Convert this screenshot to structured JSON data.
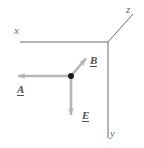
{
  "figure": {
    "width": 144,
    "height": 148,
    "background": "#ffffff"
  },
  "colors": {
    "axis": "#6a6a6a",
    "vector": "#b5b5b5",
    "vector_label": "#4f4f4f",
    "axis_label": "#6a6a6a",
    "point": "#1a1a1a"
  },
  "axes": {
    "origin": {
      "x": 108,
      "y": 42
    },
    "items": [
      {
        "name": "x",
        "label": "x",
        "label_position": {
          "x": 14,
          "y": 25
        },
        "from": {
          "x": 108,
          "y": 42
        },
        "to": {
          "x": 20,
          "y": 42
        },
        "direction": "left"
      },
      {
        "name": "z",
        "label": "z",
        "label_position": {
          "x": 126,
          "y": 4
        },
        "from": {
          "x": 108,
          "y": 42
        },
        "to": {
          "x": 133,
          "y": 14
        },
        "direction": "upper-right"
      },
      {
        "name": "y",
        "label": "y",
        "label_position": {
          "x": 110,
          "y": 128
        },
        "from": {
          "x": 108,
          "y": 42
        },
        "to": {
          "x": 108,
          "y": 138
        },
        "direction": "down"
      }
    ]
  },
  "point": {
    "label": "",
    "position": {
      "x": 71,
      "y": 76
    },
    "radius": 3
  },
  "vectors": [
    {
      "name": "A",
      "label": "A",
      "notation": "underlined",
      "from": {
        "x": 71,
        "y": 76
      },
      "to": {
        "x": 14,
        "y": 76
      },
      "direction": "left",
      "label_position": {
        "x": 17,
        "y": 84
      }
    },
    {
      "name": "B",
      "label": "B",
      "notation": "underlined",
      "from": {
        "x": 71,
        "y": 76
      },
      "to": {
        "x": 88,
        "y": 56
      },
      "direction": "upper-right",
      "label_position": {
        "x": 90,
        "y": 55
      }
    },
    {
      "name": "E",
      "label": "E",
      "notation": "underlined",
      "from": {
        "x": 71,
        "y": 76
      },
      "to": {
        "x": 71,
        "y": 119
      },
      "direction": "down",
      "label_position": {
        "x": 82,
        "y": 110
      }
    }
  ]
}
